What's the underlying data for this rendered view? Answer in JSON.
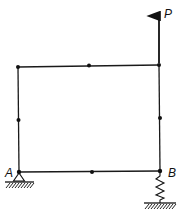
{
  "diagram": {
    "type": "structural frame",
    "load": {
      "label": "P",
      "direction": "up"
    },
    "supports": [
      {
        "label": "A",
        "type": "pin"
      },
      {
        "label": "B",
        "type": "spring"
      }
    ],
    "nodes": [
      "A",
      "bottom-mid",
      "B",
      "right-mid",
      "top-right",
      "top-mid",
      "top-left",
      "left-mid"
    ]
  }
}
